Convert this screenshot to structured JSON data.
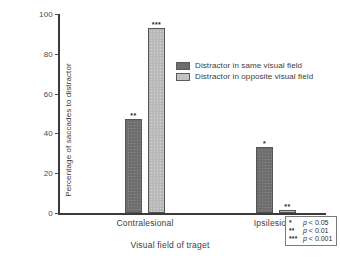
{
  "chart_data": {
    "type": "bar",
    "title": "",
    "xlabel": "Visual field of traget",
    "ylabel": "Percentage of saccades to distractor",
    "categories": [
      "Contralesional",
      "Ipsilesional"
    ],
    "ylim": [
      0,
      100
    ],
    "yticks": [
      0,
      20,
      40,
      60,
      80,
      100
    ],
    "ytick_labels": [
      "0",
      "20",
      "40",
      "60",
      "80",
      "100"
    ],
    "grid": false,
    "legend_position": "upper right inside",
    "series": [
      {
        "name": "Distractor in same visual field",
        "values": [
          47,
          33
        ],
        "annotations": [
          "**",
          "*"
        ],
        "color": "#6e6e6e"
      },
      {
        "name": "Distractor in opposite visual field",
        "values": [
          93,
          1.5
        ],
        "annotations": [
          "***",
          "**"
        ],
        "color": "#b9b9b9"
      }
    ]
  },
  "legend": {
    "items": [
      {
        "label": "Distractor in same visual field",
        "swatch": "same"
      },
      {
        "label": "Distractor in opposite visual field",
        "swatch": "opposite"
      }
    ]
  },
  "significance_key": {
    "rows": [
      {
        "stars": "*",
        "p": "p < 0.05"
      },
      {
        "stars": "**",
        "p": "p < 0.01"
      },
      {
        "stars": "***",
        "p": "p < 0.001"
      }
    ]
  }
}
